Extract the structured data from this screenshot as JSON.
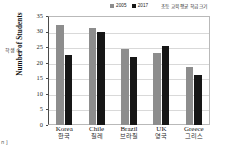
{
  "chart_data": {
    "type": "bar",
    "title": "",
    "note_ko": "초등 교육 평균 학급 크기",
    "categories": [
      "Korea",
      "Chile",
      "Brazil",
      "UK",
      "Greece"
    ],
    "categories_ko": [
      "한국",
      "칠레",
      "브라질",
      "영국",
      "그리스"
    ],
    "series": [
      {
        "name": "2005",
        "color": "#8d8d8d",
        "values": [
          32.1,
          31.2,
          24.3,
          23.0,
          18.5
        ]
      },
      {
        "name": "2017",
        "color": "#161616",
        "values": [
          22.6,
          29.8,
          21.8,
          25.4,
          16.1
        ]
      }
    ],
    "xlabel": "",
    "ylabel": "Number of Students",
    "ylabel_ko": "학생 수",
    "ylim": [
      0,
      35
    ],
    "yticks": [
      0,
      5,
      10,
      15,
      20,
      25,
      30,
      35
    ],
    "grid": true,
    "legend_position": "top-center"
  },
  "footer": {
    "corner_text": "п ]"
  }
}
